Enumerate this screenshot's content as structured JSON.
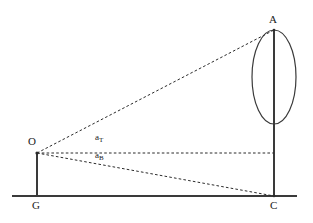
{
  "diagram": {
    "type": "geometric-line-diagram",
    "background_color": "#ffffff",
    "stroke_color": "#3a3a3a",
    "dash_color": "#2b2b2b",
    "label_color": "#1a1a1a",
    "points": [
      {
        "id": "A",
        "label": "A",
        "x": 274,
        "y": 30,
        "label_x": 269,
        "label_y": 14
      },
      {
        "id": "O",
        "label": "O",
        "x": 37,
        "y": 153,
        "label_x": 28,
        "label_y": 136
      },
      {
        "id": "G",
        "label": "G",
        "x": 37,
        "y": 196,
        "label_x": 32,
        "label_y": 200
      },
      {
        "id": "C",
        "label": "C",
        "x": 274,
        "y": 196,
        "label_x": 270,
        "label_y": 200
      }
    ],
    "angle_labels": [
      {
        "id": "aT",
        "base": "a",
        "subscript": "T",
        "x": 95,
        "y": 133
      },
      {
        "id": "aB",
        "base": "a",
        "subscript": "B",
        "x": 95,
        "y": 151
      }
    ],
    "solid_lines": [
      {
        "id": "ground-line",
        "x1": 12,
        "y1": 196,
        "x2": 297,
        "y2": 196
      },
      {
        "id": "mast-G-O",
        "x1": 37,
        "y1": 153,
        "x2": 37,
        "y2": 196
      },
      {
        "id": "vertical-C-A",
        "x1": 274,
        "y1": 30,
        "x2": 274,
        "y2": 196
      }
    ],
    "dashed_lines": [
      {
        "id": "sight-O-to-A",
        "x1": 37,
        "y1": 153,
        "x2": 274,
        "y2": 30
      },
      {
        "id": "horizon-O-to-base",
        "x1": 37,
        "y1": 153,
        "x2": 274,
        "y2": 153
      },
      {
        "id": "sight-O-to-C",
        "x1": 37,
        "y1": 153,
        "x2": 274,
        "y2": 196
      }
    ],
    "ellipse": {
      "id": "target-ellipse",
      "cx": 274,
      "cy": 77,
      "rx": 22,
      "ry": 47,
      "axis_line": {
        "x1": 274,
        "y1": 30,
        "x2": 274,
        "y2": 124
      }
    }
  }
}
